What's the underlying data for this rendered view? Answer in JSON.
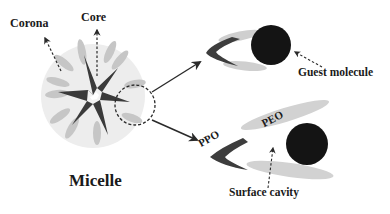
{
  "diagram": {
    "labels": {
      "corona": "Corona",
      "core": "Core",
      "micelle": "Micelle",
      "guest_molecule": "Guest molecule",
      "surface_cavity": "Surface cavity",
      "ppo": "PPO",
      "peo": "PEO"
    },
    "colors": {
      "background": "#ffffff",
      "corona_halo": "#ececec",
      "peo_petal": "#c8c8c8",
      "ppo_core": "#3a3a3a",
      "guest_molecule": "#141414",
      "arrow": "#2a2a2a",
      "text": "#1a1a1a"
    },
    "elements": [
      {
        "name": "micelle",
        "shape": "star-core with corona petals"
      },
      {
        "name": "zoom-circle",
        "style": "dashed circle"
      },
      {
        "name": "unimer-with-guest",
        "parts": [
          "PPO",
          "PEO",
          "Guest molecule"
        ]
      },
      {
        "name": "unimer-surface-cavity",
        "parts": [
          "PPO",
          "PEO",
          "Surface cavity",
          "Guest molecule"
        ]
      }
    ]
  }
}
